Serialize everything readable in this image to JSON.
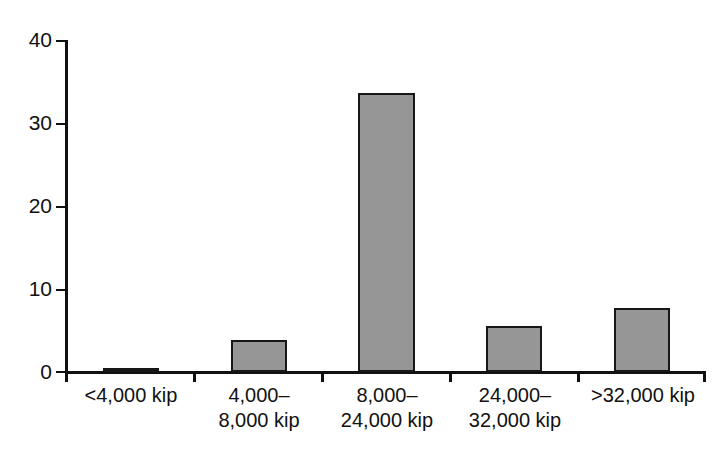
{
  "chart_data": {
    "type": "bar",
    "title": "",
    "subtitle": "",
    "xlabel": "",
    "ylabel": "",
    "categories": [
      "<4,000 kip",
      "4,000–\n8,000 kip",
      "8,000–\n24,000 kip",
      "24,000–\n32,000 kip",
      ">32,000 kip"
    ],
    "values": [
      0.5,
      3.8,
      33.6,
      5.5,
      7.7
    ],
    "ylim": [
      0,
      40
    ],
    "xlim_note": "five equal-width categorical slots",
    "yticks": [
      0,
      10,
      20,
      30,
      40
    ],
    "ytick_labels": [
      "0",
      "10",
      "20",
      "30",
      "40"
    ],
    "grid": false,
    "legend": false,
    "legend_position": "none",
    "bar_fill_color": "#969696",
    "bar_border_color": "#171717",
    "axis_color": "#111111",
    "background_color": "#ffffff"
  },
  "axes": {
    "y": {
      "ticks": [
        {
          "label": "40",
          "value": 40
        },
        {
          "label": "30",
          "value": 30
        },
        {
          "label": "20",
          "value": 20
        },
        {
          "label": "10",
          "value": 10
        },
        {
          "label": "0",
          "value": 0
        }
      ]
    },
    "x": {
      "tick_count": 6
    }
  },
  "series": [
    {
      "name": "count",
      "bars": [
        {
          "category": "<4,000 kip",
          "value": 0.5
        },
        {
          "category": "4,000–8,000 kip",
          "value": 3.8
        },
        {
          "category": "8,000–24,000 kip",
          "value": 33.6
        },
        {
          "category": "24,000–32,000 kip",
          "value": 5.5
        },
        {
          "category": ">32,000 kip",
          "value": 7.7
        }
      ]
    }
  ]
}
